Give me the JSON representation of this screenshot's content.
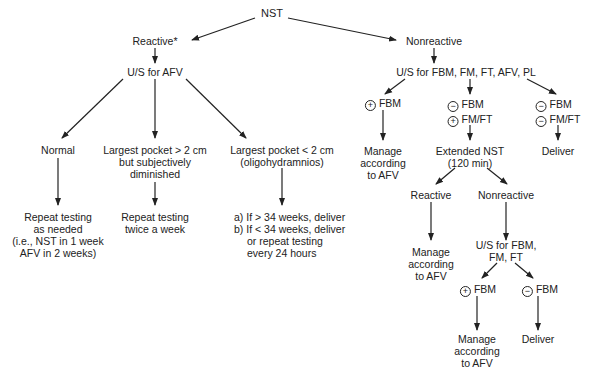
{
  "diagram": {
    "root": "NST",
    "reactive_branch": {
      "label": "Reactive*",
      "test": "U/S for AFV",
      "outcomes": [
        {
          "condition": [
            "Normal"
          ],
          "action": [
            "Repeat testing",
            "as needed",
            "(i.e., NST in 1 week",
            "AFV in 2 weeks)"
          ]
        },
        {
          "condition": [
            "Largest pocket > 2 cm",
            "but subjectively",
            "diminished"
          ],
          "action": [
            "Repeat testing",
            "twice a week"
          ]
        },
        {
          "condition": [
            "Largest pocket < 2 cm",
            "(oligohydramnios)"
          ],
          "action": [
            "a) If > 34 weeks, deliver",
            "b) If < 34 weeks, deliver",
            "or repeat testing",
            "every 24 hours"
          ]
        }
      ]
    },
    "nonreactive_branch": {
      "label": "Nonreactive",
      "test": "U/S for FBM, FM, FT, AFV, PL",
      "outcomes": [
        {
          "condition": [
            {
              "sign": "+",
              "text": "FBM"
            }
          ],
          "action": [
            "Manage",
            "according",
            "to AFV"
          ]
        },
        {
          "condition": [
            {
              "sign": "−",
              "text": "FBM"
            },
            {
              "sign": "+",
              "text": "FM/FT"
            }
          ],
          "action": [
            "Extended NST",
            "(120 min)"
          ]
        },
        {
          "condition": [
            {
              "sign": "−",
              "text": "FBM"
            },
            {
              "sign": "−",
              "text": "FM/FT"
            }
          ],
          "action": [
            "Deliver"
          ]
        }
      ],
      "extended_nst": {
        "reactive": {
          "label": "Reactive",
          "action": [
            "Manage",
            "according",
            "to AFV"
          ]
        },
        "nonreactive": {
          "label": "Nonreactive",
          "test": [
            "U/S for FBM,",
            "FM, FT"
          ],
          "outcomes": [
            {
              "condition": {
                "sign": "+",
                "text": "FBM"
              },
              "action": [
                "Manage",
                "according",
                "to AFV"
              ]
            },
            {
              "condition": {
                "sign": "−",
                "text": "FBM"
              },
              "action": [
                "Deliver"
              ]
            }
          ]
        }
      }
    }
  }
}
